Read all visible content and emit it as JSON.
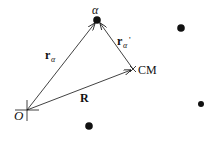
{
  "diagram": {
    "labels": {
      "origin": "O",
      "particle": "α",
      "center_of_mass": "CM",
      "r_alpha_base": "r",
      "r_alpha_sub": "α",
      "r_alpha_prime_base": "r",
      "r_alpha_prime_sub": "α",
      "r_alpha_prime_mark": "'",
      "R": "R"
    },
    "points": {
      "origin": [
        27,
        110
      ],
      "alpha": [
        97,
        20
      ],
      "cm": [
        133,
        69
      ],
      "other_particles": [
        [
          181,
          28
        ],
        [
          201,
          104
        ],
        [
          89,
          126
        ]
      ]
    },
    "vectors": [
      {
        "name": "r_alpha",
        "from": "origin",
        "to": "alpha"
      },
      {
        "name": "R",
        "from": "origin",
        "to": "cm"
      },
      {
        "name": "r_alpha_prime",
        "from": "cm",
        "to": "alpha"
      }
    ],
    "colors": {
      "ink": "#111111",
      "background": "#ffffff"
    }
  }
}
